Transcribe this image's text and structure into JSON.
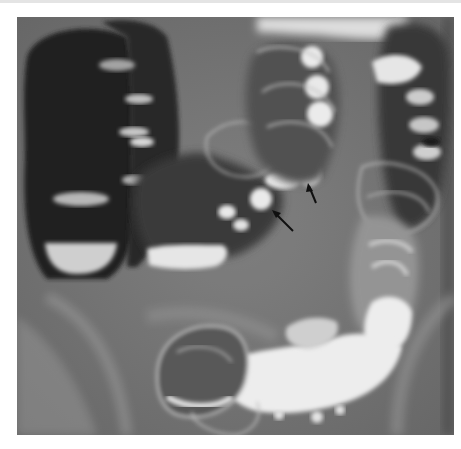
{
  "image": {
    "kind": "radiograph",
    "subject": "double-contrast barium enema of the colon",
    "palette": {
      "background": "#7a7a7a",
      "gas_lumen": "#262626",
      "barium": "#f4f4f4",
      "wall": "#bdbdbd",
      "arrow": "#111111",
      "page": "#ffffff"
    },
    "annotations": [
      {
        "type": "arrow",
        "label": "",
        "points_to": "filling defect in transverse colon"
      },
      {
        "type": "arrow",
        "label": "",
        "points_to": "filling defect in transverse colon"
      }
    ]
  }
}
